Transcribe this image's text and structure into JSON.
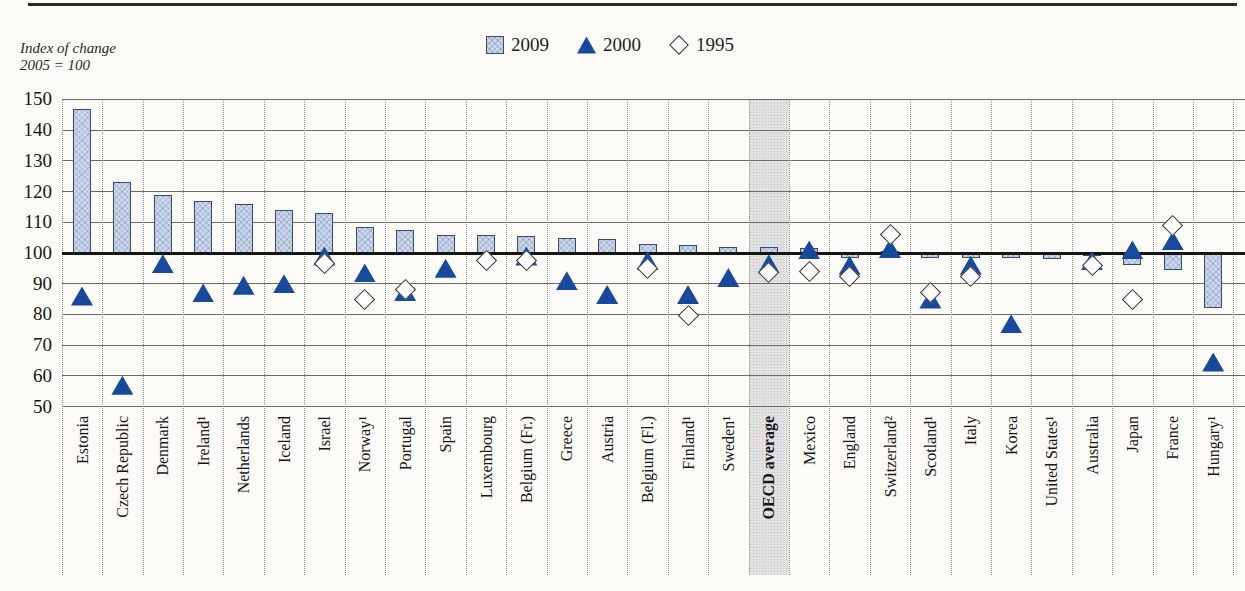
{
  "header": {
    "top_rule_color": "#2b2b2b"
  },
  "legend": {
    "entries": [
      {
        "label": "2009",
        "swatch": "bar-square"
      },
      {
        "label": "2000",
        "swatch": "triangle"
      },
      {
        "label": "1995",
        "swatch": "diamond"
      }
    ]
  },
  "chart_data": {
    "type": "bar",
    "title": "",
    "ylabel": "Index of change 2005 = 100",
    "ylabel_lines": [
      "Index of change",
      "2005 = 100"
    ],
    "ylim": [
      50,
      150
    ],
    "yticks": [
      150,
      140,
      130,
      120,
      110,
      100,
      90,
      80,
      70,
      60,
      50
    ],
    "baseline": 100,
    "grid": "horizontal solid lines; dotted vertical column separators",
    "legend_position": "top-center",
    "highlight_category": "OECD average",
    "categories": [
      "Estonia",
      "Czech Republic",
      "Denmark",
      "Ireland¹",
      "Netherlands",
      "Iceland",
      "Israel",
      "Norway¹",
      "Portugal",
      "Spain",
      "Luxembourg",
      "Belgium (Fr.)",
      "Greece",
      "Austria",
      "Belgium (Fl.)",
      "Finland¹",
      "Sweden¹",
      "OECD average",
      "Mexico",
      "England",
      "Switzerland²",
      "Scotland¹",
      "Italy",
      "Korea",
      "United States¹",
      "Australia",
      "Japan",
      "France",
      "Hungary¹"
    ],
    "series": [
      {
        "name": "2009",
        "marker": "bar",
        "color": "#cbd8ec",
        "values": [
          147,
          123,
          119,
          117,
          116,
          114,
          113,
          108.5,
          107.5,
          106,
          106,
          105.5,
          105,
          104.5,
          103,
          102.5,
          102,
          102,
          101.5,
          98.5,
          100.5,
          98.5,
          98.5,
          98.5,
          98,
          99,
          96,
          94.5,
          82
        ]
      },
      {
        "name": "2000",
        "marker": "triangle",
        "color": "#174a9c",
        "values": [
          86,
          57,
          96.5,
          87,
          89.5,
          90,
          99,
          93.5,
          87.5,
          95,
          null,
          99,
          91,
          86.5,
          97.5,
          86.5,
          92,
          96.5,
          101,
          96,
          101.5,
          85,
          96,
          77,
          null,
          97.5,
          101,
          104,
          64.5
        ]
      },
      {
        "name": "1995",
        "marker": "diamond",
        "color": "#ffffff",
        "values": [
          null,
          null,
          null,
          null,
          null,
          null,
          96.5,
          85,
          88,
          null,
          97.5,
          97.5,
          null,
          null,
          95,
          79.5,
          null,
          93.5,
          94,
          92.5,
          106,
          87,
          92.5,
          null,
          null,
          96,
          85,
          109,
          null
        ]
      }
    ]
  }
}
